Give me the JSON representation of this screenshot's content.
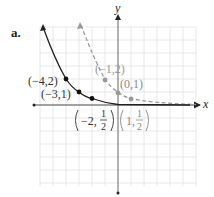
{
  "figure": {
    "part_label": "a.",
    "x_axis_label": "x",
    "y_axis_label": "y",
    "colors": {
      "solid_curve": "#222222",
      "dashed_curve": "#999999",
      "grid": "#dddddd",
      "axis": "#555555"
    },
    "solid_points": [
      {
        "label": "(−4,2)",
        "x": -4,
        "y": 2
      },
      {
        "label": "(−3,1)",
        "x": -3,
        "y": 1
      },
      {
        "label": "(−2, 1/2)",
        "x": -2,
        "y": 0.5
      }
    ],
    "dashed_points": [
      {
        "label": "(−1,2)",
        "x": -1,
        "y": 2
      },
      {
        "label": "(0,1)",
        "x": 0,
        "y": 1
      },
      {
        "label": "(1, 1/2)",
        "x": 1,
        "y": 0.5
      }
    ],
    "labels": {
      "p1": "(−4,2)",
      "p2": "(−3,1)",
      "p3_prefix": "−2,",
      "p3_num": "1",
      "p3_den": "2",
      "p4": "(−1,2)",
      "p5": "(0,1)",
      "p6_prefix": "1,",
      "p6_num": "1",
      "p6_den": "2"
    }
  }
}
